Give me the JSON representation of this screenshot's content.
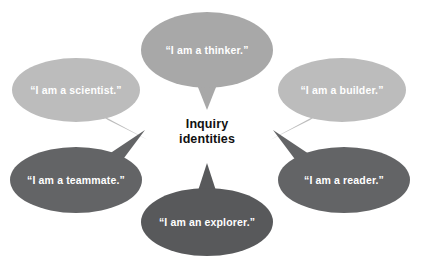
{
  "diagram": {
    "title": "Inquiry identities",
    "center": {
      "line1": "Inquiry",
      "line2": "identities",
      "color": "#111111"
    },
    "background": "#ffffff",
    "palette": {
      "light_gray": "#bcbcbc",
      "medium_gray": "#a8a8a8",
      "dark_gray": "#636466",
      "darker_gray": "#58595b",
      "text_on_bubble": "#ffffff"
    },
    "bubbles": [
      {
        "id": "thinker",
        "label": "“I am a thinker.”",
        "color": "#a8a8a8",
        "position": "top-center",
        "tail_direction": "down"
      },
      {
        "id": "scientist",
        "label": "“I am a scientist.”",
        "color": "#bcbcbc",
        "position": "upper-left",
        "tail_direction": "down-right"
      },
      {
        "id": "builder",
        "label": "“I am a builder.”",
        "color": "#bcbcbc",
        "position": "upper-right",
        "tail_direction": "down-left"
      },
      {
        "id": "teammate",
        "label": "“I am a teammate.”",
        "color": "#636466",
        "position": "lower-left",
        "tail_direction": "up-right"
      },
      {
        "id": "reader",
        "label": "“I am a reader.”",
        "color": "#636466",
        "position": "lower-right",
        "tail_direction": "up-left"
      },
      {
        "id": "explorer",
        "label": "“I am an explorer.”",
        "color": "#58595b",
        "position": "bottom-center",
        "tail_direction": "up"
      }
    ]
  }
}
